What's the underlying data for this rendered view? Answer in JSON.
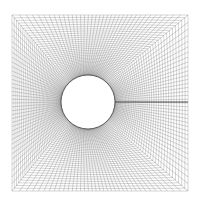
{
  "diagram": {
    "type": "structured O-grid mesh around circular cylinder",
    "domain_box": {
      "left": 12,
      "top": 15,
      "right": 188,
      "bottom": 191
    },
    "cylinder": {
      "cx": 88,
      "cy": 102,
      "r": 27
    },
    "radial_lines": 144,
    "circumferential_lines": 40,
    "wake_cut": {
      "x1": 115,
      "y1": 102,
      "x2": 188,
      "y2": 102
    },
    "colors": {
      "mesh_line": "#555555",
      "wake_cut": "#222222",
      "cylinder_outline": "#333333",
      "background": "#ffffff"
    }
  }
}
